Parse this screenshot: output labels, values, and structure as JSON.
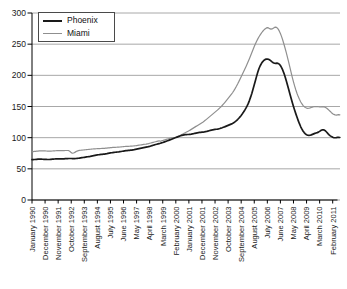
{
  "figure": {
    "background": "#ffffff"
  },
  "colors": {
    "axis": "#000000",
    "gridline": "#a8a8a8",
    "tick_text": "#1a1a1a",
    "phoenix_line": "#1a1a1a",
    "miami_line": "#8f8f8f",
    "legend_border": "#4a4a4a"
  },
  "chart_data": {
    "type": "line",
    "title": "",
    "xlabel": "",
    "ylabel": "",
    "ylim": [
      0,
      300
    ],
    "y_ticks": [
      0,
      50,
      100,
      150,
      200,
      250,
      300
    ],
    "grid": "horizontal",
    "x_unit": "month",
    "x_start": "January 1990",
    "x_end": "August 2011",
    "x_tick_month_indices": [
      0,
      11,
      22,
      33,
      44,
      55,
      66,
      77,
      88,
      99,
      110,
      121,
      132,
      143,
      154,
      165,
      176,
      187,
      198,
      209,
      220,
      231,
      242,
      253
    ],
    "x_tick_labels": [
      "January 1990",
      "December 1990",
      "November 1991",
      "October 1992",
      "September 1993",
      "August 1994",
      "July 1995",
      "June 1996",
      "May 1997",
      "April 1998",
      "March 1999",
      "February 2000",
      "January 2001",
      "December 2001",
      "November 2002",
      "October 2003",
      "September 2004",
      "August 2005",
      "July 2006",
      "June 2007",
      "May 2008",
      "April 2009",
      "March 2010",
      "February 2011"
    ],
    "legend": {
      "position": "top-left",
      "entries": [
        {
          "label": "Phoenix",
          "color": "#1a1a1a",
          "stroke_width": 2
        },
        {
          "label": "Miami",
          "color": "#8f8f8f",
          "stroke_width": 1.4
        }
      ]
    },
    "series": [
      {
        "name": "Phoenix",
        "color": "#1a1a1a",
        "stroke_width": 1.7,
        "values": [
          64.8,
          64.9,
          65.0,
          65.1,
          65.3,
          65.5,
          65.6,
          65.6,
          65.5,
          65.4,
          65.3,
          65.2,
          65.1,
          65.0,
          65.0,
          65.1,
          65.3,
          65.5,
          65.7,
          65.8,
          65.9,
          66.0,
          66.0,
          66.0,
          65.9,
          65.9,
          66.0,
          66.1,
          66.3,
          66.4,
          66.5,
          66.6,
          66.6,
          66.6,
          66.5,
          66.5,
          66.5,
          66.6,
          66.8,
          67.0,
          67.3,
          67.6,
          67.9,
          68.2,
          68.5,
          68.8,
          69.1,
          69.4,
          69.7,
          70.0,
          70.4,
          70.8,
          71.2,
          71.6,
          72.0,
          72.3,
          72.6,
          72.9,
          73.1,
          73.3,
          73.5,
          73.7,
          74.0,
          74.3,
          74.7,
          75.1,
          75.5,
          75.8,
          76.1,
          76.4,
          76.6,
          76.8,
          77.0,
          77.2,
          77.5,
          77.8,
          78.2,
          78.5,
          78.8,
          79.1,
          79.3,
          79.5,
          79.7,
          79.9,
          80.1,
          80.4,
          80.7,
          81.1,
          81.5,
          81.9,
          82.3,
          82.7,
          83.1,
          83.5,
          83.9,
          84.3,
          84.7,
          85.1,
          85.6,
          86.1,
          86.7,
          87.3,
          87.9,
          88.5,
          89.0,
          89.5,
          90.0,
          90.5,
          91.0,
          91.6,
          92.2,
          92.9,
          93.6,
          94.3,
          95.0,
          95.7,
          96.4,
          97.1,
          97.9,
          98.7,
          99.5,
          100.2,
          100.9,
          101.6,
          102.3,
          103.0,
          103.6,
          104.1,
          104.5,
          104.8,
          105.0,
          105.1,
          105.2,
          105.4,
          105.7,
          106.1,
          106.5,
          107.0,
          107.4,
          107.8,
          108.1,
          108.4,
          108.6,
          108.8,
          109.0,
          109.3,
          109.7,
          110.1,
          110.6,
          111.1,
          111.6,
          112.1,
          112.5,
          112.9,
          113.2,
          113.5,
          113.8,
          114.2,
          114.7,
          115.3,
          115.9,
          116.6,
          117.3,
          118.1,
          118.9,
          119.7,
          120.5,
          121.3,
          122.1,
          123.1,
          124.3,
          125.7,
          127.3,
          129.1,
          131.1,
          133.3,
          135.7,
          138.3,
          141.1,
          144.1,
          147.3,
          150.9,
          155.0,
          159.9,
          165.4,
          171.4,
          177.9,
          184.8,
          191.8,
          198.7,
          205.2,
          210.9,
          215.4,
          218.9,
          221.7,
          223.8,
          225.2,
          226.0,
          226.2,
          225.8,
          224.7,
          223.2,
          221.6,
          220.2,
          219.4,
          219.2,
          219.5,
          219.2,
          218.0,
          215.7,
          212.4,
          208.2,
          203.2,
          197.4,
          191.0,
          184.2,
          177.2,
          170.2,
          163.2,
          156.4,
          150.0,
          144.0,
          138.2,
          132.7,
          127.4,
          122.4,
          117.9,
          114.0,
          110.7,
          108.1,
          106.1,
          104.7,
          103.9,
          103.7,
          103.9,
          104.5,
          105.3,
          106.1,
          106.9,
          107.5,
          108.1,
          108.9,
          110.1,
          111.5,
          112.5,
          112.7,
          112.1,
          110.7,
          108.7,
          106.5,
          104.5,
          102.9,
          101.7,
          100.7,
          100.1,
          99.9,
          100.1,
          100.4,
          100.5,
          100.3
        ]
      },
      {
        "name": "Miami",
        "color": "#8f8f8f",
        "stroke_width": 1.2,
        "values": [
          77.4,
          77.6,
          77.9,
          78.1,
          78.3,
          78.5,
          78.7,
          78.8,
          78.9,
          78.9,
          78.8,
          78.7,
          78.6,
          78.5,
          78.4,
          78.4,
          78.5,
          78.6,
          78.8,
          78.9,
          79.0,
          79.1,
          79.1,
          79.1,
          79.1,
          79.1,
          79.2,
          79.3,
          79.4,
          79.4,
          79.4,
          79.2,
          77.8,
          76.0,
          75.0,
          75.4,
          76.4,
          77.6,
          78.5,
          79.1,
          79.5,
          79.8,
          80.0,
          80.2,
          80.4,
          80.6,
          80.8,
          81.0,
          81.2,
          81.4,
          81.6,
          81.8,
          82.0,
          82.1,
          82.2,
          82.3,
          82.4,
          82.5,
          82.6,
          82.7,
          82.8,
          82.9,
          83.1,
          83.3,
          83.5,
          83.7,
          83.9,
          84.1,
          84.3,
          84.4,
          84.5,
          84.6,
          84.7,
          84.8,
          85.0,
          85.2,
          85.4,
          85.6,
          85.8,
          85.9,
          86.0,
          86.1,
          86.2,
          86.3,
          86.4,
          86.6,
          86.8,
          87.0,
          87.3,
          87.6,
          87.9,
          88.2,
          88.5,
          88.8,
          89.1,
          89.4,
          89.7,
          90.1,
          90.5,
          91.0,
          91.5,
          92.0,
          92.5,
          93.0,
          93.5,
          94.0,
          94.5,
          95.0,
          94.2,
          94.8,
          95.4,
          96.0,
          96.6,
          97.2,
          97.8,
          98.3,
          98.8,
          99.2,
          99.6,
          99.8,
          100.1,
          100.6,
          101.3,
          102.1,
          103.0,
          104.0,
          105.0,
          106.0,
          107.0,
          108.0,
          109.0,
          110.0,
          111.0,
          112.1,
          113.3,
          114.5,
          115.7,
          116.9,
          118.1,
          119.3,
          120.5,
          121.7,
          122.9,
          124.1,
          125.3,
          126.7,
          128.2,
          129.8,
          131.4,
          133.0,
          134.6,
          136.2,
          137.8,
          139.4,
          141.0,
          142.6,
          144.2,
          145.9,
          147.7,
          149.6,
          151.6,
          153.7,
          155.9,
          158.2,
          160.5,
          162.9,
          165.3,
          167.7,
          170.1,
          172.9,
          175.9,
          179.1,
          182.5,
          186.1,
          189.9,
          193.9,
          197.9,
          201.9,
          205.9,
          209.9,
          213.9,
          218.1,
          222.5,
          227.1,
          231.9,
          236.7,
          241.5,
          246.1,
          250.5,
          254.7,
          258.5,
          261.9,
          264.9,
          267.7,
          270.3,
          272.5,
          274.3,
          275.7,
          276.5,
          276.1,
          274.9,
          274.1,
          274.5,
          275.7,
          276.9,
          277.3,
          276.5,
          274.5,
          271.3,
          267.1,
          262.1,
          256.3,
          249.9,
          243.1,
          235.9,
          228.5,
          220.7,
          212.7,
          204.7,
          196.9,
          189.5,
          182.7,
          176.5,
          170.9,
          165.9,
          161.5,
          157.7,
          154.5,
          151.9,
          149.9,
          148.4,
          147.5,
          147.1,
          147.2,
          147.7,
          148.4,
          149.1,
          149.6,
          149.9,
          150.0,
          149.9,
          149.6,
          149.3,
          149.2,
          149.4,
          149.6,
          149.3,
          148.4,
          147.1,
          145.5,
          143.7,
          141.9,
          140.1,
          138.5,
          137.3,
          136.5,
          136.3,
          136.7,
          137.1,
          136.7
        ]
      }
    ]
  }
}
